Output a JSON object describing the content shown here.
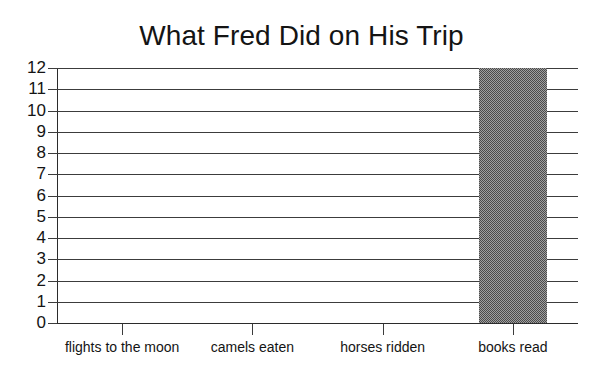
{
  "chart_data": {
    "type": "bar",
    "title": "What Fred Did on His Trip",
    "xlabel": "",
    "ylabel": "",
    "categories": [
      "flights to the moon",
      "camels eaten",
      "horses ridden",
      "books read"
    ],
    "values": [
      0,
      0,
      0,
      12
    ],
    "series": [
      {
        "name": "count",
        "values": [
          0,
          0,
          0,
          12
        ]
      }
    ],
    "ylim": [
      0,
      12
    ],
    "y_ticks": [
      0,
      1,
      2,
      3,
      4,
      5,
      6,
      7,
      8,
      9,
      10,
      11,
      12
    ],
    "y_tick_labels": [
      "0",
      "1",
      "2",
      "3",
      "4",
      "5",
      "6",
      "7",
      "8",
      "9",
      "10",
      "11",
      "12"
    ],
    "grid": true,
    "grid_axis": "y",
    "legend": false,
    "legend_position": "none",
    "bar_color": "#7d7d7d",
    "bar_pattern": "dithered-gray",
    "axis_color": "#2b2b2b",
    "grid_color": "#3c3c3c",
    "background_color": "#ffffff",
    "annotations": []
  }
}
